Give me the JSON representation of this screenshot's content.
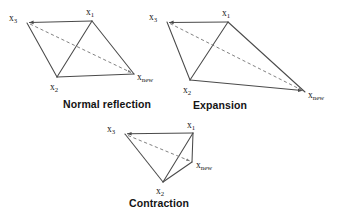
{
  "figure": {
    "background_color": "#ffffff",
    "line_color": "#4a4a4a",
    "dashed_color": "#7a7a7a",
    "text_color": "#141414",
    "panels": [
      {
        "id": "normal-reflection",
        "caption": "Normal reflection",
        "caption_pos": {
          "x": 63,
          "y": 108
        },
        "vertices": [
          {
            "key": "x1",
            "base": "x",
            "sub": "1",
            "label": "x₁",
            "x": 92,
            "y": 21,
            "label_x": 86,
            "label_y": 15
          },
          {
            "key": "x2",
            "base": "x",
            "sub": "2",
            "label": "x₂",
            "x": 57,
            "y": 77,
            "label_x": 50,
            "label_y": 90
          },
          {
            "key": "x3",
            "base": "x",
            "sub": "3",
            "label": "x₃",
            "x": 27,
            "y": 23,
            "label_x": 9,
            "label_y": 21
          },
          {
            "key": "xnew",
            "base": "x",
            "sub": "new",
            "label": "xnew",
            "x": 134,
            "y": 74,
            "label_x": 137,
            "label_y": 80
          }
        ]
      },
      {
        "id": "expansion",
        "caption": "Expansion",
        "caption_pos": {
          "x": 193,
          "y": 109
        },
        "vertices": [
          {
            "key": "x1",
            "base": "x",
            "sub": "1",
            "label": "x₁",
            "x": 228,
            "y": 22,
            "label_x": 222,
            "label_y": 16
          },
          {
            "key": "x2",
            "base": "x",
            "sub": "2",
            "label": "x₂",
            "x": 190,
            "y": 80,
            "label_x": 183,
            "label_y": 93
          },
          {
            "key": "x3",
            "base": "x",
            "sub": "3",
            "label": "x₃",
            "x": 167,
            "y": 22,
            "label_x": 149,
            "label_y": 20
          },
          {
            "key": "xnew",
            "base": "x",
            "sub": "new",
            "label": "xnew",
            "x": 305,
            "y": 92,
            "label_x": 308,
            "label_y": 98
          }
        ]
      },
      {
        "id": "contraction",
        "caption": "Contraction",
        "caption_pos": {
          "x": 129,
          "y": 207
        },
        "vertices": [
          {
            "key": "x1",
            "base": "x",
            "sub": "1",
            "label": "x₁",
            "x": 193,
            "y": 133,
            "label_x": 187,
            "label_y": 128
          },
          {
            "key": "x2",
            "base": "x",
            "sub": "2",
            "label": "x₂",
            "x": 163,
            "y": 182,
            "label_x": 156,
            "label_y": 194
          },
          {
            "key": "x3",
            "base": "x",
            "sub": "3",
            "label": "x₃",
            "x": 125,
            "y": 134,
            "label_x": 107,
            "label_y": 132
          },
          {
            "key": "xnew",
            "base": "x",
            "sub": "new",
            "label": "xnew",
            "x": 192,
            "y": 162,
            "label_x": 196,
            "label_y": 168
          }
        ]
      }
    ]
  }
}
